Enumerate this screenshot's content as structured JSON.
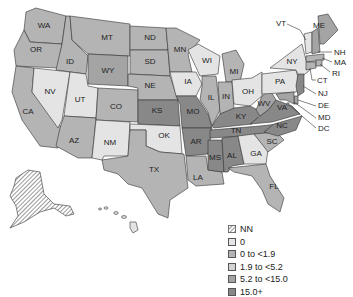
{
  "map": {
    "region": "United States",
    "legend": [
      {
        "key": "nn",
        "label": "NN",
        "color": "hatch"
      },
      {
        "key": "c0",
        "label": "0",
        "color": "#e4e4e4"
      },
      {
        "key": "c1",
        "label": "0 to <1.9",
        "color": "#b4b4b4"
      },
      {
        "key": "c2",
        "label": "1.9 to <5.2",
        "color": "#d3d3d3"
      },
      {
        "key": "c3",
        "label": "5.2 to <15.0",
        "color": "#a4a4a4"
      },
      {
        "key": "c4",
        "label": "15.0+",
        "color": "#888888"
      }
    ],
    "states": {
      "WA": {
        "label": "WA",
        "category": "0 to <1.9"
      },
      "OR": {
        "label": "OR",
        "category": "0 to <1.9"
      },
      "CA": {
        "label": "CA",
        "category": "0 to <1.9"
      },
      "ID": {
        "label": "ID",
        "category": "0 to <1.9"
      },
      "NV": {
        "label": "NV",
        "category": "0"
      },
      "UT": {
        "label": "UT",
        "category": "0"
      },
      "AZ": {
        "label": "AZ",
        "category": "0 to <1.9"
      },
      "MT": {
        "label": "MT",
        "category": "0 to <1.9"
      },
      "WY": {
        "label": "WY",
        "category": "5.2 to <15.0"
      },
      "CO": {
        "label": "CO",
        "category": "0 to <1.9"
      },
      "NM": {
        "label": "NM",
        "category": "0"
      },
      "ND": {
        "label": "ND",
        "category": "0 to <1.9"
      },
      "SD": {
        "label": "SD",
        "category": "0 to <1.9"
      },
      "NE": {
        "label": "NE",
        "category": "0 to <1.9"
      },
      "KS": {
        "label": "KS",
        "category": "15.0+"
      },
      "OK": {
        "label": "OK",
        "category": "0"
      },
      "TX": {
        "label": "TX",
        "category": "0 to <1.9"
      },
      "MN": {
        "label": "MN",
        "category": "0 to <1.9"
      },
      "IA": {
        "label": "IA",
        "category": "0"
      },
      "MO": {
        "label": "MO",
        "category": "15.0+"
      },
      "AR": {
        "label": "AR",
        "category": "15.0+"
      },
      "LA": {
        "label": "LA",
        "category": "0 to <1.9"
      },
      "WI": {
        "label": "WI",
        "category": "0"
      },
      "IL": {
        "label": "IL",
        "category": "0 to <1.9"
      },
      "MI": {
        "label": "MI",
        "category": "0 to <1.9"
      },
      "IN": {
        "label": "IN",
        "category": "0 to <1.9"
      },
      "OH": {
        "label": "OH",
        "category": "0"
      },
      "KY": {
        "label": "KY",
        "category": "15.0+"
      },
      "TN": {
        "label": "TN",
        "category": "15.0+"
      },
      "MS": {
        "label": "MS",
        "category": "15.0+"
      },
      "AL": {
        "label": "AL",
        "category": "15.0+"
      },
      "GA": {
        "label": "GA",
        "category": "0"
      },
      "FL": {
        "label": "FL",
        "category": "0 to <1.9"
      },
      "SC": {
        "label": "SC",
        "category": "0 to <1.9"
      },
      "NC": {
        "label": "NC",
        "category": "15.0+"
      },
      "VA": {
        "label": "VA",
        "category": "15.0+"
      },
      "WV": {
        "label": "WV",
        "category": "5.2 to <15.0"
      },
      "PA": {
        "label": "PA",
        "category": "0"
      },
      "NY": {
        "label": "NY",
        "category": "0"
      },
      "VT": {
        "label": "VT",
        "category": "0"
      },
      "NH": {
        "label": "NH",
        "category": "5.2 to <15.0"
      },
      "ME": {
        "label": "ME",
        "category": "5.2 to <15.0"
      },
      "MA": {
        "label": "MA",
        "category": "0 to <1.9"
      },
      "RI": {
        "label": "RI",
        "category": "0 to <1.9"
      },
      "CT": {
        "label": "CT",
        "category": "0 to <1.9"
      },
      "NJ": {
        "label": "NJ",
        "category": "15.0+"
      },
      "DE": {
        "label": "DE",
        "category": "5.2 to <15.0"
      },
      "MD": {
        "label": "MD",
        "category": "5.2 to <15.0"
      },
      "DC": {
        "label": "DC",
        "category": "5.2 to <15.0"
      },
      "AK": {
        "label": "",
        "category": "NN"
      },
      "HI": {
        "label": "",
        "category": "0"
      }
    }
  }
}
